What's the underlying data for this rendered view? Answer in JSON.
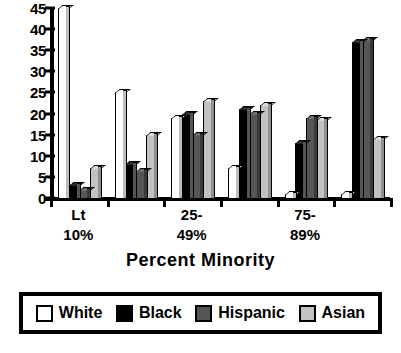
{
  "chart_data": {
    "type": "bar",
    "title": "",
    "xlabel": "Percent Minority",
    "ylabel": "",
    "ylim": [
      0,
      45
    ],
    "yticks": [
      0,
      5,
      10,
      15,
      20,
      25,
      30,
      35,
      40,
      45
    ],
    "grid": false,
    "legend_position": "bottom",
    "categories": [
      "Lt 10%",
      "",
      "25-49%",
      "",
      "75-89%",
      ""
    ],
    "category_lines": [
      [
        "Lt",
        "10%"
      ],
      [
        "",
        ""
      ],
      [
        "25-",
        "49%"
      ],
      [
        "",
        ""
      ],
      [
        "75-",
        "89%"
      ],
      [
        "",
        ""
      ]
    ],
    "series": [
      {
        "name": "White",
        "color": "#ffffff",
        "values": [
          45,
          25,
          19,
          7,
          1,
          1
        ]
      },
      {
        "name": "Black",
        "color": "#000000",
        "values": [
          3,
          8,
          20,
          21,
          13,
          37
        ]
      },
      {
        "name": "Hispanic",
        "color": "#565656",
        "values": [
          2,
          6.5,
          15,
          20,
          19,
          37.5
        ]
      },
      {
        "name": "Asian",
        "color": "#c2c2c2",
        "values": [
          7,
          15,
          23,
          22,
          18.5,
          14
        ]
      }
    ]
  },
  "legend": {
    "entries": [
      {
        "label": "White"
      },
      {
        "label": "Black"
      },
      {
        "label": "Hispanic"
      },
      {
        "label": "Asian"
      }
    ]
  },
  "footer": {
    "note": ""
  }
}
